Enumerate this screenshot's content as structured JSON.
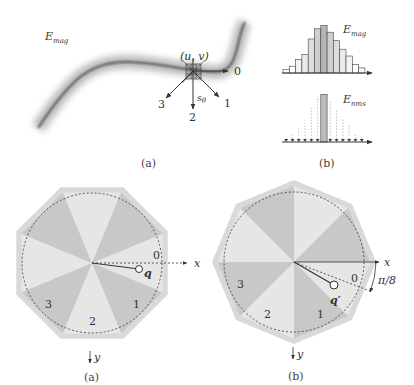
{
  "panel_top_a": {
    "field_label": "E",
    "field_sub": "mag",
    "point_label": "(u, v)",
    "direction_labels": [
      "0",
      "1",
      "2",
      "3"
    ],
    "step_label": "s",
    "step_sub": "θ",
    "caption": "(a)"
  },
  "panel_top_b": {
    "hist_label": "E",
    "hist_sub": "mag",
    "nms_label": "E",
    "nms_sub": "nms",
    "caption": "(b)",
    "hist_bars": [
      2,
      4,
      8,
      11,
      20,
      26,
      28,
      24,
      19,
      14,
      10,
      5,
      3
    ],
    "hist_shades": [
      "#fff",
      "#fff",
      "#f3f3f3",
      "#ebebeb",
      "#dedede",
      "#cfcfcf",
      "#b5b5b5",
      "#cfcfcf",
      "#dedede",
      "#ebebeb",
      "#f3f3f3",
      "#fff",
      "#fff"
    ]
  },
  "panel_bottom_a": {
    "sector_labels": [
      "0",
      "1",
      "2",
      "3"
    ],
    "axis_x": "x",
    "axis_y": "y",
    "point_label": "q",
    "caption": "(a)"
  },
  "panel_bottom_b": {
    "sector_labels": [
      "0",
      "1",
      "2",
      "3"
    ],
    "axis_x": "x",
    "axis_y": "y",
    "point_label": "q′",
    "angle_label": "π/8",
    "caption": "(b)"
  },
  "colors": {
    "sector_dark": "#c8c8c8",
    "sector_light": "#e6e6e6",
    "outline_light": "#d9d9d9",
    "stroke": "#333333"
  }
}
